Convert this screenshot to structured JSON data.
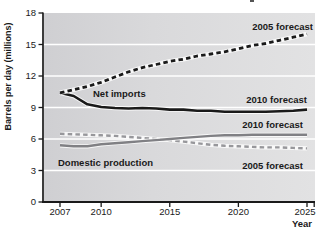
{
  "chart_data": {
    "type": "line",
    "title": "",
    "ylabel": "Barrels per day (millions)",
    "xlabel": "Year",
    "x_ticks": [
      2007,
      2010,
      2015,
      2020,
      2025
    ],
    "y_ticks": [
      0,
      3,
      6,
      9,
      12,
      15,
      18
    ],
    "ylim": [
      0,
      18
    ],
    "xlim": [
      2005.8,
      2025.6
    ],
    "grid": "horizontal-white",
    "plot_bg_colors": [
      "#cfcfd2",
      "#d9d9db",
      "#e2e2e3"
    ],
    "grid_color": "#ffffff",
    "axis_color": "#1a1a1a",
    "series": [
      {
        "name": "Domestic production — 2005 forecast",
        "group": "Domestic production",
        "forecast": "2005 forecast",
        "style": "dashed",
        "color": "#97979b",
        "width": 2.4,
        "dash": "4.5 3.2",
        "x": [
          2007,
          2008,
          2009,
          2010,
          2011,
          2012,
          2013,
          2014,
          2015,
          2016,
          2017,
          2018,
          2019,
          2020,
          2021,
          2022,
          2023,
          2024,
          2025
        ],
        "values": [
          6.5,
          6.45,
          6.4,
          6.35,
          6.3,
          6.2,
          6.1,
          6.0,
          5.9,
          5.75,
          5.6,
          5.45,
          5.35,
          5.3,
          5.25,
          5.2,
          5.2,
          5.15,
          5.1
        ]
      },
      {
        "name": "Domestic production — 2010 forecast",
        "group": "Domestic production",
        "forecast": "2010 forecast",
        "style": "solid",
        "color": "#808084",
        "width": 2.4,
        "dash": "",
        "x": [
          2007,
          2008,
          2009,
          2010,
          2011,
          2012,
          2013,
          2014,
          2015,
          2016,
          2017,
          2018,
          2019,
          2020,
          2021,
          2022,
          2023,
          2024,
          2025
        ],
        "values": [
          5.4,
          5.3,
          5.3,
          5.5,
          5.6,
          5.7,
          5.8,
          5.9,
          6.0,
          6.1,
          6.2,
          6.3,
          6.35,
          6.35,
          6.4,
          6.4,
          6.4,
          6.4,
          6.4
        ]
      },
      {
        "name": "Net imports — 2010 forecast",
        "group": "Net imports",
        "forecast": "2010 forecast",
        "style": "solid",
        "color": "#1a1a1a",
        "width": 2.6,
        "dash": "",
        "x": [
          2007,
          2008,
          2009,
          2010,
          2011,
          2012,
          2013,
          2014,
          2015,
          2016,
          2017,
          2018,
          2019,
          2020,
          2021,
          2022,
          2023,
          2024,
          2025
        ],
        "values": [
          10.4,
          10.1,
          9.3,
          9.05,
          8.95,
          8.9,
          8.95,
          8.9,
          8.8,
          8.8,
          8.7,
          8.7,
          8.6,
          8.6,
          8.6,
          8.6,
          8.65,
          8.7,
          8.8
        ]
      },
      {
        "name": "Net imports — 2005 forecast",
        "group": "Net imports",
        "forecast": "2005 forecast",
        "style": "dashed",
        "color": "#1a1a1a",
        "width": 2.8,
        "dash": "4.5 3.2",
        "x": [
          2007,
          2008,
          2009,
          2010,
          2011,
          2012,
          2013,
          2014,
          2015,
          2016,
          2017,
          2018,
          2019,
          2020,
          2021,
          2022,
          2023,
          2024,
          2025
        ],
        "values": [
          10.4,
          10.7,
          11.0,
          11.4,
          11.9,
          12.4,
          12.8,
          13.1,
          13.4,
          13.6,
          13.9,
          14.1,
          14.3,
          14.6,
          14.9,
          15.1,
          15.4,
          15.7,
          16.0
        ]
      }
    ],
    "annotations": [
      {
        "id": "label-2005-forecast-imports",
        "text": "2005 forecast",
        "x": 313,
        "y": 30,
        "anchor": "end"
      },
      {
        "id": "label-net-imports",
        "text": "Net imports",
        "x": 93,
        "y": 96.5,
        "anchor": "start"
      },
      {
        "id": "label-2010-forecast-imports",
        "text": "2010 forecast",
        "x": 307,
        "y": 103,
        "anchor": "end"
      },
      {
        "id": "label-2010-forecast-domestic",
        "text": "2010 forecast",
        "x": 303,
        "y": 128,
        "anchor": "end"
      },
      {
        "id": "label-domestic-production",
        "text": "Domestic production",
        "x": 58,
        "y": 166,
        "anchor": "start"
      },
      {
        "id": "label-2005-forecast-domestic",
        "text": "2005 forecast",
        "x": 303,
        "y": 168.5,
        "anchor": "end"
      }
    ],
    "legend_position": "inline-annotations"
  }
}
